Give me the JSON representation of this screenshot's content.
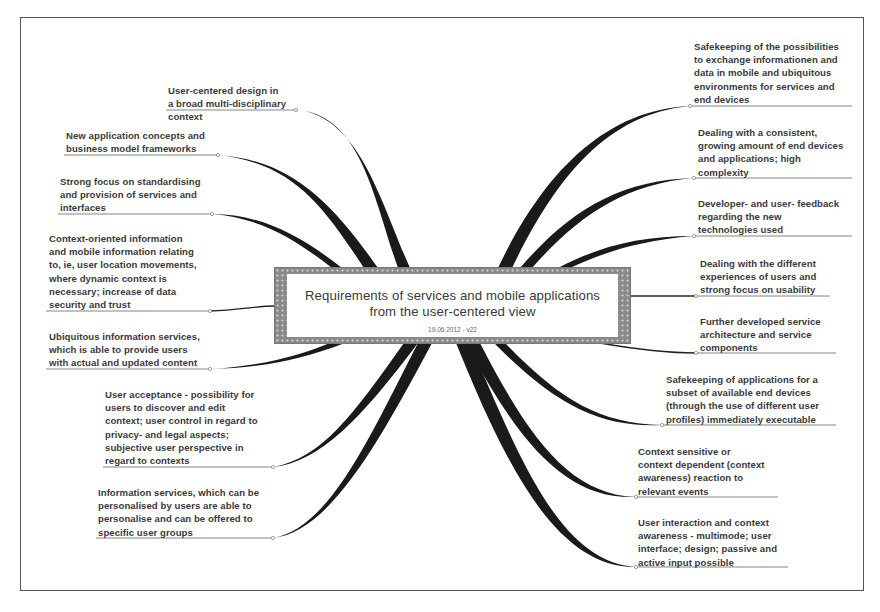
{
  "diagram": {
    "type": "mind-map",
    "center": {
      "title": "Requirements of services and mobile applications\nfrom the user-centered view",
      "subtitle": "19.06.2012 - v22"
    },
    "left_nodes": [
      {
        "text": "User-centered design in\na broad multi-disciplinary\ncontext"
      },
      {
        "text": "New application concepts and\nbusiness model frameworks"
      },
      {
        "text": "Strong focus on standardising\nand provision of services and\ninterfaces"
      },
      {
        "text": "Context-oriented information\nand mobile information relating\nto, ie, user location movements,\nwhere dynamic context is\nnecessary; increase of data\nsecurity and trust"
      },
      {
        "text": "Ubiquitous information services,\nwhich is able to provide users\nwith actual and updated content"
      },
      {
        "text": "User acceptance - possibility for\nusers to discover and edit\ncontext; user control in regard to\nprivacy- and legal aspects;\nsubjective user perspective in\nregard to contexts"
      },
      {
        "text": "Information services, which can be\npersonalised by users are able to\npersonalise and can be offered to\nspecific user groups"
      }
    ],
    "right_nodes": [
      {
        "text": "Safekeeping of the possibilities\nto exchange informationen and\ndata in mobile and ubiquitous\nenvironments for services and\nend devices"
      },
      {
        "text": "Dealing with a consistent,\ngrowing amount of end devices\nand applications; high\ncomplexity"
      },
      {
        "text": "Developer- and user- feedback\nregarding the new\ntechnologies used"
      },
      {
        "text": "Dealing with the different\nexperiences of users and\nstrong focus on usability"
      },
      {
        "text": "Further developed service\narchitecture and service\ncomponents"
      },
      {
        "text": "Safekeeping of applications for a\nsubset of available end devices\n(through the use of different user\nprofiles) immediately executable"
      },
      {
        "text": "Context sensitive or\ncontext dependent (context\nawareness) reaction to\nrelevant events"
      },
      {
        "text": "User interaction and context\nawareness - multimode; user\ninterface; design; passive and\nactive input possible"
      }
    ],
    "colors": {
      "branch": "#1a1a1a",
      "underline": "#777777",
      "text": "#3a3a3a",
      "center_border": "#8a8a8a",
      "frame": "#555555"
    }
  }
}
